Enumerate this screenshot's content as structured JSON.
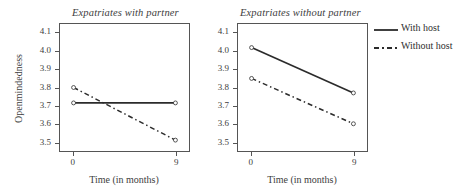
{
  "chart_data": {
    "type": "line",
    "title": "",
    "panels": [
      {
        "title": "Expatriates with partner",
        "xlabel": "Time (in months)",
        "ylabel": "Openmindedness",
        "x": [
          0,
          9
        ],
        "xticks": [
          "0",
          "9"
        ],
        "yticks": [
          "3.5",
          "3.6",
          "3.7",
          "3.8",
          "3.9",
          "4.0",
          "4.1"
        ],
        "ylim": [
          3.45,
          4.15
        ],
        "xlim": [
          -1.2,
          10.2
        ],
        "grid": false,
        "series": [
          {
            "name": "With host",
            "style": "solid",
            "values": [
              3.715,
              3.715
            ]
          },
          {
            "name": "Without host",
            "style": "dashdot",
            "values": [
              3.8,
              3.51
            ]
          }
        ]
      },
      {
        "title": "Expatriates without partner",
        "xlabel": "Time (in months)",
        "ylabel": "",
        "x": [
          0,
          9
        ],
        "xticks": [
          "0",
          "9"
        ],
        "yticks": [
          "3.5",
          "3.6",
          "3.7",
          "3.8",
          "3.9",
          "4.0",
          "4.1"
        ],
        "ylim": [
          3.45,
          4.15
        ],
        "xlim": [
          -1.2,
          10.2
        ],
        "grid": false,
        "series": [
          {
            "name": "With host",
            "style": "solid",
            "values": [
              4.02,
              3.77
            ]
          },
          {
            "name": "Without host",
            "style": "dashdot",
            "values": [
              3.85,
              3.6
            ]
          }
        ]
      }
    ],
    "legend": {
      "position": "top-right",
      "entries": [
        {
          "label": "With host",
          "style": "solid"
        },
        {
          "label": "Without host",
          "style": "dashdot"
        }
      ]
    },
    "colors": {
      "line": "#2b2b2b",
      "axis": "#555555",
      "text": "#3d3d3d",
      "background": "#ffffff"
    }
  }
}
